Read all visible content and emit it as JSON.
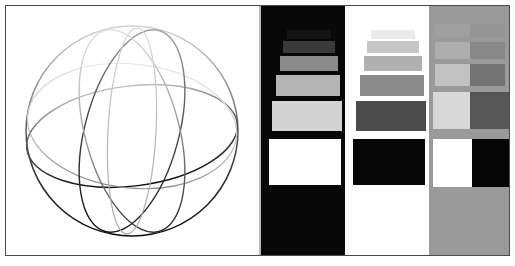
{
  "figure": {
    "width": 515,
    "height": 266,
    "background": "#ffffff",
    "frame_color": "#4a4a4a"
  },
  "panels": [
    {
      "id": "sphere",
      "name": "wireframe-sphere-panel",
      "label": "Wireframe sphere line-quality target",
      "background": "#ffffff",
      "x": 0,
      "width": 253,
      "description": "Anti-aliased sphere wireframe: outer circle, equator ellipse, two tilted meridian ellipses, rendered with a tonal gradient from light gray at top to black at bottom"
    },
    {
      "id": "dark-ramp",
      "name": "dark-background-ramp-panel",
      "label": "Light patches on black background",
      "background": "#080808",
      "x": 255,
      "width": 84,
      "patch_count": 6
    },
    {
      "id": "light-ramp",
      "name": "light-background-ramp-panel",
      "label": "Dark patches on white background",
      "background": "#ffffff",
      "x": 339,
      "width": 84,
      "patch_count": 6
    },
    {
      "id": "gray-pairs",
      "name": "gray-background-pair-panel",
      "label": "Light and dark patch pairs on mid gray background",
      "background": "#9a9a9a",
      "x": 423,
      "width": 82,
      "pair_count": 5
    }
  ],
  "chart_data": {
    "type": "heatmap",
    "subtitle": "Grayscale contrast ramps with wireframe sphere line target",
    "xlabel": "",
    "ylabel": "",
    "grid": false,
    "legend": "none",
    "dark_ramp": {
      "background": "#080808",
      "axis_note": "patch luminance increases from top (near black) to bottom (pure white)",
      "patches": [
        {
          "index": 0,
          "label": "P1",
          "color": "#141414",
          "luminance": 8,
          "x": 26,
          "y": 24,
          "w": 44,
          "h": 9
        },
        {
          "index": 1,
          "label": "P2",
          "color": "#3a3a3a",
          "luminance": 23,
          "x": 22,
          "y": 35,
          "w": 52,
          "h": 12
        },
        {
          "index": 2,
          "label": "P3",
          "color": "#8b8b8b",
          "luminance": 55,
          "x": 19,
          "y": 50,
          "w": 58,
          "h": 15
        },
        {
          "index": 3,
          "label": "P4",
          "color": "#b4b4b4",
          "luminance": 71,
          "x": 15,
          "y": 69,
          "w": 64,
          "h": 21
        },
        {
          "index": 4,
          "label": "P5",
          "color": "#d3d3d3",
          "luminance": 83,
          "x": 11,
          "y": 95,
          "w": 70,
          "h": 30
        },
        {
          "index": 5,
          "label": "P6",
          "color": "#ffffff",
          "luminance": 100,
          "x": 8,
          "y": 133,
          "w": 72,
          "h": 46
        }
      ]
    },
    "light_ramp": {
      "background": "#ffffff",
      "axis_note": "patch luminance decreases from top (near white) to bottom (pure black)",
      "patches": [
        {
          "index": 0,
          "label": "Q1",
          "color": "#ebebeb",
          "luminance": 92,
          "x": 26,
          "y": 24,
          "w": 44,
          "h": 9
        },
        {
          "index": 1,
          "label": "Q2",
          "color": "#c6c6c6",
          "luminance": 78,
          "x": 22,
          "y": 35,
          "w": 52,
          "h": 12
        },
        {
          "index": 2,
          "label": "Q3",
          "color": "#b0b0b0",
          "luminance": 69,
          "x": 19,
          "y": 50,
          "w": 58,
          "h": 15
        },
        {
          "index": 3,
          "label": "Q4",
          "color": "#8a8a8a",
          "luminance": 54,
          "x": 15,
          "y": 69,
          "w": 64,
          "h": 21
        },
        {
          "index": 4,
          "label": "Q5",
          "color": "#4b4b4b",
          "luminance": 29,
          "x": 11,
          "y": 95,
          "w": 70,
          "h": 30
        },
        {
          "index": 5,
          "label": "Q6",
          "color": "#060606",
          "luminance": 2,
          "x": 8,
          "y": 133,
          "w": 72,
          "h": 46
        }
      ]
    },
    "gray_pairs": {
      "background": "#9a9a9a",
      "axis_note": "symmetric light/dark patch pairs, contrast increasing from top to bottom",
      "pairs": [
        {
          "index": 0,
          "label": "R1",
          "light_color": "#9f9f9f",
          "dark_color": "#959595",
          "delta": 5,
          "y": 18,
          "h": 13,
          "light_x": 6,
          "dark_x": 41,
          "w": 35
        },
        {
          "index": 1,
          "label": "R2",
          "light_color": "#adadad",
          "dark_color": "#888888",
          "delta": 18,
          "y": 36,
          "h": 17,
          "light_x": 6,
          "dark_x": 41,
          "w": 35
        },
        {
          "index": 2,
          "label": "R3",
          "light_color": "#c2c2c2",
          "dark_color": "#737373",
          "delta": 40,
          "y": 58,
          "h": 22,
          "light_x": 6,
          "dark_x": 41,
          "w": 35
        },
        {
          "index": 3,
          "label": "R4",
          "light_color": "#d7d7d7",
          "dark_color": "#575757",
          "delta": 66,
          "y": 86,
          "h": 37,
          "light_x": 4,
          "dark_x": 41,
          "w": 39
        },
        {
          "index": 4,
          "label": "R5",
          "light_color": "#ffffff",
          "dark_color": "#050505",
          "delta": 99,
          "y": 133,
          "h": 48,
          "light_x": 4,
          "dark_x": 43,
          "w": 39
        }
      ]
    },
    "sphere_target": {
      "background": "#ffffff",
      "center_x": 125,
      "center_y": 125,
      "radius": 106,
      "curves": [
        {
          "name": "outer-circle",
          "stroke_top": "#cfcfcf",
          "stroke_bottom": "#111111",
          "width": 1.4
        },
        {
          "name": "equator-ellipse",
          "stroke_top": "#b5b5b5",
          "stroke_bottom": "#0d0d0d",
          "width": 1.4
        },
        {
          "name": "meridian-left",
          "stroke_top": "#9a9a9a",
          "stroke_bottom": "#101010",
          "width": 1.4
        },
        {
          "name": "meridian-right",
          "stroke_top": "#cccccc",
          "stroke_bottom": "#b0b0b0",
          "width": 1.3
        },
        {
          "name": "meridian-tilt-a",
          "stroke_top": "#dcdcdc",
          "stroke_bottom": "#2a2a2a",
          "width": 1.3
        },
        {
          "name": "meridian-tilt-b",
          "stroke_top": "#e2e2e2",
          "stroke_bottom": "#8f8f8f",
          "width": 1.2
        }
      ]
    }
  }
}
